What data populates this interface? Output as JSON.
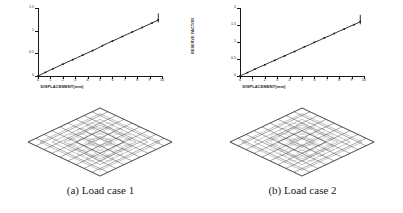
{
  "figure": {
    "panels": [
      {
        "id": "a",
        "caption": "(a) Load case 1",
        "chart_ref": 0
      },
      {
        "id": "b",
        "caption": "(b) Load case 2",
        "chart_ref": 1
      }
    ]
  },
  "chart_data": [
    {
      "type": "line",
      "title": "",
      "xlabel": "DISPLACEMENT(mm)",
      "ylabel": "RESERVE FACTOR",
      "xlim": [
        0,
        10
      ],
      "ylim": [
        0,
        1.5
      ],
      "xticks": [
        0,
        1,
        2,
        3,
        4,
        5,
        6,
        7,
        8,
        9,
        10
      ],
      "xticklabels": [
        "0",
        "1",
        "2",
        "3",
        "4",
        "5",
        "6",
        "7",
        "8",
        "9",
        "10"
      ],
      "yticks": [
        0,
        0.5,
        1,
        1.5
      ],
      "yticklabels": [
        "0",
        "0.5",
        "1",
        "1.5"
      ],
      "grid": false,
      "legend": "none",
      "series": [
        {
          "name": "Load case 1",
          "x": [
            0,
            0.3,
            0.6,
            0.9,
            1.2,
            1.6,
            2.0,
            2.4,
            2.8,
            3.2,
            3.6,
            4.0,
            4.4,
            4.8,
            5.2,
            5.6,
            6.0,
            6.4,
            6.8,
            7.2,
            7.6,
            8.0,
            8.4,
            8.8,
            9.2,
            9.6,
            9.7
          ],
          "y": [
            0.0,
            0.04,
            0.08,
            0.12,
            0.16,
            0.21,
            0.26,
            0.31,
            0.36,
            0.41,
            0.46,
            0.51,
            0.56,
            0.61,
            0.67,
            0.72,
            0.77,
            0.82,
            0.87,
            0.92,
            0.97,
            1.02,
            1.07,
            1.12,
            1.17,
            1.22,
            1.24
          ]
        }
      ],
      "end_marker": {
        "x": 9.7,
        "y_low": 1.18,
        "y_high": 1.38
      }
    },
    {
      "type": "line",
      "title": "",
      "xlabel": "DISPLACEMENT(mm)",
      "ylabel": "RESERVE FACTOR",
      "xlim": [
        0,
        10
      ],
      "ylim": [
        0,
        2
      ],
      "xticks": [
        0,
        1,
        2,
        3,
        4,
        5,
        6,
        7,
        8,
        9,
        10
      ],
      "xticklabels": [
        "0",
        "1",
        "2",
        "3",
        "4",
        "5",
        "6",
        "7",
        "8",
        "9",
        "10"
      ],
      "yticks": [
        0,
        0.5,
        1,
        1.5,
        2
      ],
      "yticklabels": [
        "0",
        "0.5",
        "1",
        "1.5",
        "2"
      ],
      "grid": false,
      "legend": "none",
      "series": [
        {
          "name": "Load case 2",
          "x": [
            0,
            0.3,
            0.6,
            0.9,
            1.2,
            1.6,
            2.0,
            2.4,
            2.8,
            3.2,
            3.6,
            4.0,
            4.4,
            4.8,
            5.2,
            5.6,
            6.0,
            6.4,
            6.8,
            7.2,
            7.6,
            8.0,
            8.4,
            8.8,
            9.2,
            9.6,
            9.7
          ],
          "y": [
            0.0,
            0.05,
            0.1,
            0.15,
            0.2,
            0.27,
            0.33,
            0.4,
            0.46,
            0.53,
            0.59,
            0.66,
            0.72,
            0.79,
            0.86,
            0.92,
            0.99,
            1.05,
            1.12,
            1.18,
            1.25,
            1.32,
            1.38,
            1.45,
            1.51,
            1.58,
            1.6
          ]
        }
      ],
      "end_marker": {
        "x": 9.7,
        "y_low": 1.52,
        "y_high": 1.8
      }
    }
  ],
  "mesh": {
    "name": "diamond-lattice-mesh",
    "shape": "rhombus",
    "description": "deformed diamond lattice grid structure"
  }
}
